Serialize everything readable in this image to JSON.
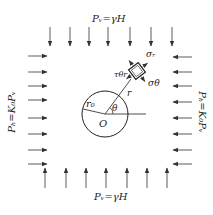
{
  "diagram": {
    "type": "tunnel stress diagram",
    "labels": {
      "top_load": "Pᵥ=γH",
      "bottom_load": "Pᵥ=γH",
      "left_load": "Pₕ=K₀Pᵥ",
      "right_load": "Pₕ=K₀Pᵥ",
      "origin": "O",
      "radius_hole": "r₀",
      "radius": "r",
      "angle": "θ",
      "sigma_r": "σᵣ",
      "sigma_theta": "σθ",
      "tau": "τθr"
    },
    "colors": {
      "stroke": "#333333",
      "background": "#ffffff"
    },
    "vertical_arrow_x": [
      50,
      70,
      89,
      108,
      130,
      151,
      172
    ],
    "horizontal_arrow_y": [
      56,
      72,
      86,
      100,
      118,
      134,
      150,
      165
    ]
  }
}
